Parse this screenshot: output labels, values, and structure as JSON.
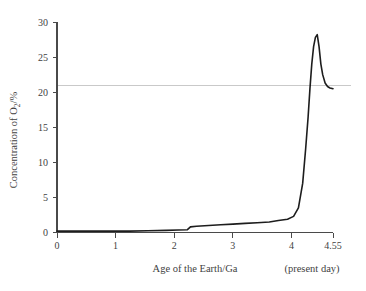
{
  "chart_data": {
    "type": "line",
    "title": "",
    "subtitle": "",
    "xlabel": "Age of the Earth/Ga",
    "ylabel": "Concentration of O2/%",
    "ylabel_parts": {
      "prefix": "Concentration of O",
      "subscript": "2",
      "suffix": "/%"
    },
    "xlim": [
      0,
      4.55
    ],
    "ylim": [
      0,
      30
    ],
    "grid": false,
    "legend": null,
    "xticks": [
      0,
      1,
      2,
      3,
      4,
      4.55
    ],
    "xtick_labels": [
      "0",
      "1",
      "2",
      "3",
      "4",
      "4.55"
    ],
    "yticks": [
      0,
      5,
      10,
      15,
      20,
      25,
      30
    ],
    "ytick_labels": [
      "0",
      "5",
      "10",
      "15",
      "20",
      "25",
      "30"
    ],
    "annotations": [
      {
        "text": "(present day)",
        "x": 4.55,
        "placement": "below-right-axis"
      }
    ],
    "reference_lines": [
      {
        "orientation": "horizontal",
        "value": 21,
        "label": "",
        "color": "#c9c9c9",
        "description": "present-day atmospheric oxygen level"
      }
    ],
    "series": [
      {
        "name": "Atmospheric O2 concentration",
        "color": "#1d1d1d",
        "x": [
          0.0,
          0.3,
          0.6,
          0.9,
          1.2,
          1.5,
          1.8,
          2.0,
          2.15,
          2.2,
          2.3,
          2.5,
          2.7,
          2.9,
          3.1,
          3.3,
          3.5,
          3.65,
          3.8,
          3.9,
          3.98,
          4.05,
          4.1,
          4.14,
          4.17,
          4.2,
          4.23,
          4.26,
          4.29,
          4.32,
          4.35,
          4.38,
          4.42,
          4.46,
          4.5,
          4.55
        ],
        "y": [
          0.2,
          0.2,
          0.2,
          0.2,
          0.2,
          0.25,
          0.3,
          0.35,
          0.4,
          0.8,
          0.9,
          1.0,
          1.1,
          1.2,
          1.3,
          1.4,
          1.5,
          1.7,
          1.9,
          2.3,
          3.5,
          7.0,
          12.0,
          16.5,
          20.5,
          24.0,
          26.5,
          27.8,
          28.2,
          26.5,
          24.0,
          22.5,
          21.3,
          20.8,
          20.6,
          20.5
        ]
      }
    ],
    "peak": {
      "x": 4.29,
      "y": 28.2
    }
  },
  "axes": {
    "x_axis_name": "age-axis",
    "y_axis_name": "concentration-axis"
  }
}
